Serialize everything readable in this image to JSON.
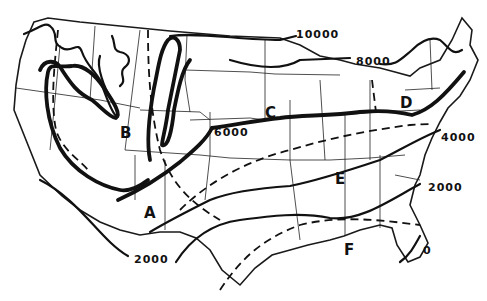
{
  "map": {
    "subject": "United States contour map (hand-drawn)",
    "background": "#ffffff",
    "ink": "#111111",
    "contour_labels": [
      {
        "text": "10000",
        "x": 296,
        "y": 29
      },
      {
        "text": "8000",
        "x": 356,
        "y": 56
      },
      {
        "text": "6000",
        "x": 214,
        "y": 127
      },
      {
        "text": "4000",
        "x": 441,
        "y": 132
      },
      {
        "text": "2000",
        "x": 428,
        "y": 182
      },
      {
        "text": "2000",
        "x": 134,
        "y": 254
      },
      {
        "text": "0",
        "x": 423,
        "y": 245
      }
    ],
    "region_labels": [
      {
        "text": "A",
        "x": 144,
        "y": 206
      },
      {
        "text": "B",
        "x": 120,
        "y": 126
      },
      {
        "text": "C",
        "x": 265,
        "y": 106
      },
      {
        "text": "D",
        "x": 400,
        "y": 96
      },
      {
        "text": "E",
        "x": 335,
        "y": 172
      },
      {
        "text": "F",
        "x": 344,
        "y": 243
      }
    ]
  }
}
